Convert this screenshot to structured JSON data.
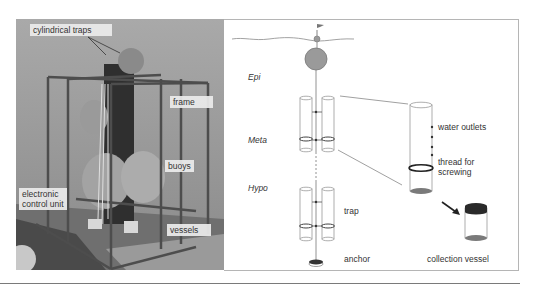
{
  "figure": {
    "photo": {
      "labels": {
        "cylindrical_traps": "cylindrical traps",
        "frame": "frame",
        "buoys": "buoys",
        "electronic_control_unit_line1": "electronic",
        "electronic_control_unit_line2": "control unit",
        "vessels": "vessels"
      }
    },
    "diagram": {
      "zones": {
        "epi": "Epi",
        "meta": "Meta",
        "hypo": "Hypo"
      },
      "labels": {
        "water_outlets": "water outlets",
        "thread_line1": "thread for",
        "thread_line2": "screwing",
        "trap": "trap",
        "anchor": "anchor",
        "collection_vessel": "collection vessel"
      },
      "colors": {
        "buoy_fill": "#9a9a9a",
        "sediment_fill": "#7a7a7a",
        "cap_fill": "#2a2a2a",
        "outline": "#8a8a8a",
        "panel_border": "#b5b5b5"
      }
    }
  }
}
